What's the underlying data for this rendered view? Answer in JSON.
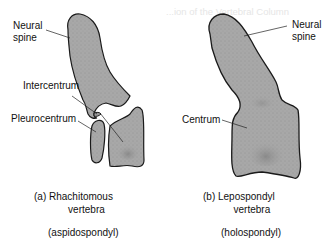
{
  "background_text": {
    "heading": "...ion of the Vertebral Column",
    "lines": [
      "",
      "",
      "",
      "",
      "",
      "",
      "",
      "",
      "",
      "",
      "",
      "",
      "",
      ""
    ]
  },
  "figure_a": {
    "labels": {
      "neural_spine": "Neural\nspine",
      "neural_spine_line1": "Neural",
      "neural_spine_line2": "spine",
      "intercentrum": "Intercentrum",
      "pleurocentrum": "Pleurocentrum"
    },
    "caption_line1": "(a) Rhachitomous",
    "caption_line2": "vertebra",
    "subcaption": "(aspidospondyl)"
  },
  "figure_b": {
    "labels": {
      "neural_spine_line1": "Neural",
      "neural_spine_line2": "spine",
      "centrum": "Centrum"
    },
    "caption_line1": "(b) Lepospondyl",
    "caption_line2": "vertebra",
    "subcaption": "(holospondyl)"
  },
  "colors": {
    "bone_fill": "#a9a9a9",
    "outline": "#1a1a1a",
    "text": "#111111"
  }
}
